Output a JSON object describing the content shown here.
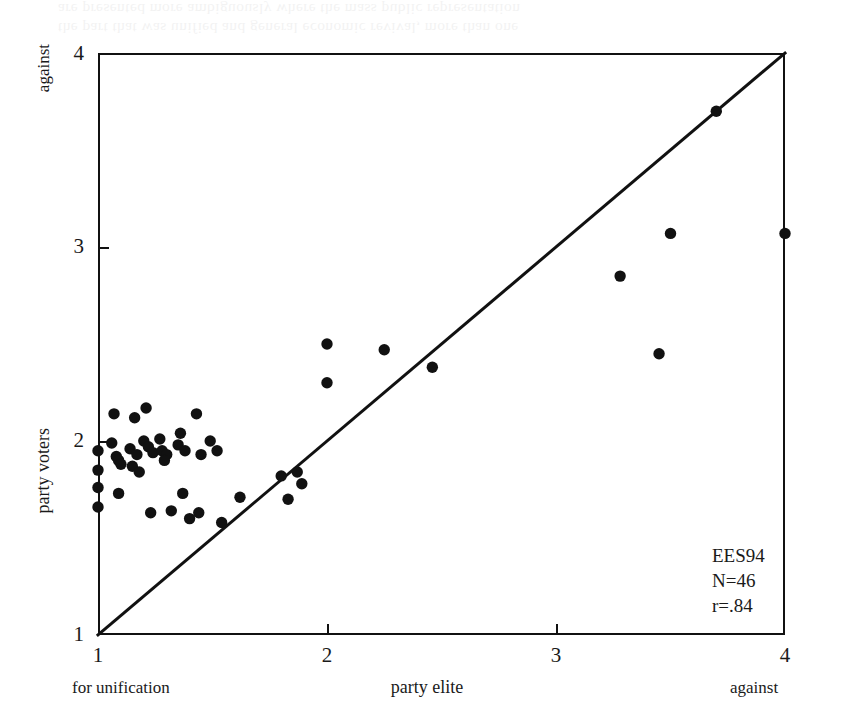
{
  "figure": {
    "ghost_text": "the part that was unified and general economic revival, more than one\nare presented more ambiguously where the mass public representation",
    "annotation": {
      "study": "EES94",
      "sample_size": "N=46",
      "correlation": "r=.84"
    },
    "axes": {
      "y": {
        "top_label": "against",
        "title": "party voters",
        "ticks": [
          "1",
          "2",
          "3",
          "4"
        ]
      },
      "x": {
        "left_label": "for unification",
        "title": "party elite",
        "right_label": "against",
        "ticks": [
          "1",
          "2",
          "3",
          "4"
        ]
      }
    }
  },
  "chart_data": {
    "type": "scatter",
    "title": "",
    "xlabel": "party elite",
    "ylabel": "party voters",
    "xlim": [
      1,
      4
    ],
    "ylim": [
      1,
      4
    ],
    "xticks": [
      1,
      2,
      3,
      4
    ],
    "yticks": [
      1,
      2,
      3,
      4
    ],
    "grid": false,
    "legend": false,
    "x_axis_endpoint_labels": {
      "left": "for unification",
      "right": "against"
    },
    "y_axis_endpoint_labels": {
      "bottom": "for unification",
      "top": "against"
    },
    "annotations": [
      "EES94",
      "N=46",
      "r=.84"
    ],
    "n_points": 46,
    "correlation": 0.84,
    "reference_line": {
      "description": "diagonal identity line y = x",
      "from": [
        1,
        1
      ],
      "to": [
        4,
        4
      ]
    },
    "marker": {
      "shape": "circle",
      "color": "#111111",
      "size_px": 9
    },
    "points": [
      {
        "x": 1.0,
        "y": 1.95
      },
      {
        "x": 1.0,
        "y": 1.85
      },
      {
        "x": 1.0,
        "y": 1.76
      },
      {
        "x": 1.0,
        "y": 1.66
      },
      {
        "x": 1.07,
        "y": 2.14
      },
      {
        "x": 1.06,
        "y": 1.99
      },
      {
        "x": 1.08,
        "y": 1.92
      },
      {
        "x": 1.09,
        "y": 1.9
      },
      {
        "x": 1.1,
        "y": 1.88
      },
      {
        "x": 1.09,
        "y": 1.73
      },
      {
        "x": 1.16,
        "y": 2.12
      },
      {
        "x": 1.14,
        "y": 1.96
      },
      {
        "x": 1.17,
        "y": 1.93
      },
      {
        "x": 1.15,
        "y": 1.87
      },
      {
        "x": 1.18,
        "y": 1.84
      },
      {
        "x": 1.21,
        "y": 2.17
      },
      {
        "x": 1.2,
        "y": 2.0
      },
      {
        "x": 1.22,
        "y": 1.97
      },
      {
        "x": 1.24,
        "y": 1.94
      },
      {
        "x": 1.23,
        "y": 1.63
      },
      {
        "x": 1.27,
        "y": 2.01
      },
      {
        "x": 1.28,
        "y": 1.95
      },
      {
        "x": 1.3,
        "y": 1.93
      },
      {
        "x": 1.29,
        "y": 1.9
      },
      {
        "x": 1.32,
        "y": 1.64
      },
      {
        "x": 1.36,
        "y": 2.04
      },
      {
        "x": 1.35,
        "y": 1.98
      },
      {
        "x": 1.38,
        "y": 1.95
      },
      {
        "x": 1.37,
        "y": 1.73
      },
      {
        "x": 1.4,
        "y": 1.6
      },
      {
        "x": 1.43,
        "y": 2.14
      },
      {
        "x": 1.45,
        "y": 1.93
      },
      {
        "x": 1.44,
        "y": 1.63
      },
      {
        "x": 1.49,
        "y": 2.0
      },
      {
        "x": 1.52,
        "y": 1.95
      },
      {
        "x": 1.54,
        "y": 1.58
      },
      {
        "x": 1.62,
        "y": 1.71
      },
      {
        "x": 1.8,
        "y": 1.82
      },
      {
        "x": 1.87,
        "y": 1.84
      },
      {
        "x": 1.89,
        "y": 1.78
      },
      {
        "x": 1.83,
        "y": 1.7
      },
      {
        "x": 2.0,
        "y": 2.5
      },
      {
        "x": 2.0,
        "y": 2.3
      },
      {
        "x": 2.25,
        "y": 2.47
      },
      {
        "x": 2.46,
        "y": 2.38
      },
      {
        "x": 3.28,
        "y": 2.85
      },
      {
        "x": 3.45,
        "y": 2.45
      },
      {
        "x": 3.5,
        "y": 3.07
      },
      {
        "x": 3.7,
        "y": 3.7
      },
      {
        "x": 4.0,
        "y": 3.07
      }
    ]
  }
}
